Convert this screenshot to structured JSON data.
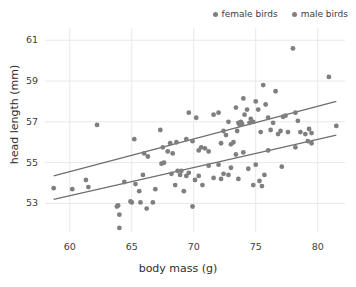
{
  "chart_data": {
    "type": "scatter",
    "title": "",
    "xlabel": "body mass (g)",
    "ylabel": "head length (mm)",
    "xlim": [
      58.0,
      82.2
    ],
    "ylim": [
      51.6,
      61.6
    ],
    "xticks": [
      "60",
      "65",
      "70",
      "75",
      "80"
    ],
    "xtick_values": [
      60,
      65,
      70,
      75,
      80
    ],
    "yticks": [
      "53",
      "55",
      "57",
      "59",
      "61"
    ],
    "ytick_values": [
      53,
      55,
      57,
      59,
      61
    ],
    "grid": true,
    "grid_color": "#e8e8e8",
    "point_color": "#7f7f7f",
    "line_color": "#6e6e6e",
    "legend_position": "top-right",
    "legend": [
      {
        "name": "female birds",
        "color": "#7f7f7f",
        "marker": "circle"
      },
      {
        "name": "male birds",
        "color": "#7f7f7f",
        "marker": "circle"
      }
    ],
    "series": [
      {
        "name": "female birds",
        "color": "#7f7f7f",
        "points": [
          [
            62.2,
            56.85
          ],
          [
            65.2,
            56.15
          ],
          [
            66.0,
            55.45
          ],
          [
            66.3,
            55.3
          ],
          [
            67.3,
            56.6
          ],
          [
            67.5,
            55.75
          ],
          [
            67.9,
            55.55
          ],
          [
            68.1,
            55.95
          ],
          [
            68.3,
            55.45
          ],
          [
            68.6,
            56.0
          ],
          [
            69.4,
            56.15
          ],
          [
            69.6,
            57.45
          ],
          [
            69.9,
            56.05
          ],
          [
            70.2,
            57.2
          ],
          [
            70.4,
            55.6
          ],
          [
            70.6,
            55.75
          ],
          [
            70.9,
            55.7
          ],
          [
            71.2,
            55.55
          ],
          [
            71.6,
            57.35
          ],
          [
            72.0,
            57.45
          ],
          [
            72.2,
            55.95
          ],
          [
            72.4,
            56.55
          ],
          [
            72.6,
            56.35
          ],
          [
            72.8,
            57.0
          ],
          [
            73.0,
            55.9
          ],
          [
            73.2,
            56.0
          ],
          [
            73.4,
            57.7
          ],
          [
            73.5,
            56.55
          ],
          [
            73.6,
            56.95
          ],
          [
            73.7,
            56.85
          ],
          [
            73.8,
            57.0
          ],
          [
            73.9,
            56.9
          ],
          [
            74.0,
            58.15
          ],
          [
            74.1,
            57.35
          ],
          [
            74.3,
            57.6
          ],
          [
            74.5,
            56.95
          ],
          [
            74.6,
            57.15
          ],
          [
            74.8,
            57.0
          ],
          [
            75.0,
            58.0
          ],
          [
            75.2,
            57.6
          ],
          [
            75.4,
            56.5
          ],
          [
            75.6,
            58.8
          ],
          [
            75.8,
            57.85
          ],
          [
            76.0,
            57.2
          ],
          [
            76.2,
            56.6
          ],
          [
            76.4,
            56.95
          ],
          [
            76.6,
            58.5
          ],
          [
            76.8,
            56.4
          ],
          [
            77.0,
            56.55
          ],
          [
            77.2,
            57.25
          ],
          [
            77.4,
            57.3
          ],
          [
            77.6,
            56.5
          ],
          [
            78.0,
            60.6
          ],
          [
            78.2,
            57.45
          ],
          [
            78.4,
            57.05
          ],
          [
            78.6,
            56.5
          ],
          [
            79.0,
            56.4
          ],
          [
            79.3,
            56.65
          ],
          [
            79.5,
            56.45
          ],
          [
            80.9,
            59.2
          ],
          [
            81.5,
            56.8
          ]
        ]
      },
      {
        "name": "male birds",
        "color": "#7f7f7f",
        "points": [
          [
            58.7,
            53.75
          ],
          [
            60.2,
            53.7
          ],
          [
            61.3,
            54.15
          ],
          [
            61.5,
            53.8
          ],
          [
            63.8,
            52.85
          ],
          [
            63.9,
            52.9
          ],
          [
            64.0,
            52.45
          ],
          [
            64.0,
            51.8
          ],
          [
            64.4,
            54.05
          ],
          [
            64.9,
            53.1
          ],
          [
            65.0,
            53.05
          ],
          [
            65.3,
            53.95
          ],
          [
            65.6,
            53.6
          ],
          [
            65.7,
            53.05
          ],
          [
            65.9,
            54.4
          ],
          [
            66.2,
            52.75
          ],
          [
            66.7,
            53.05
          ],
          [
            66.9,
            53.7
          ],
          [
            67.4,
            54.95
          ],
          [
            67.6,
            55.0
          ],
          [
            68.2,
            54.45
          ],
          [
            68.5,
            53.9
          ],
          [
            68.7,
            54.6
          ],
          [
            68.9,
            54.4
          ],
          [
            69.0,
            54.6
          ],
          [
            69.2,
            53.6
          ],
          [
            69.4,
            54.35
          ],
          [
            69.6,
            54.5
          ],
          [
            69.9,
            52.85
          ],
          [
            70.1,
            54.15
          ],
          [
            70.4,
            54.35
          ],
          [
            70.7,
            53.9
          ],
          [
            71.2,
            54.85
          ],
          [
            71.6,
            54.25
          ],
          [
            72.0,
            54.9
          ],
          [
            72.2,
            54.2
          ],
          [
            72.4,
            54.45
          ],
          [
            72.8,
            54.4
          ],
          [
            73.0,
            54.75
          ],
          [
            73.4,
            55.4
          ],
          [
            73.6,
            54.2
          ],
          [
            74.0,
            55.5
          ],
          [
            74.4,
            54.7
          ],
          [
            74.8,
            53.9
          ],
          [
            75.0,
            54.9
          ],
          [
            75.3,
            54.1
          ],
          [
            75.5,
            53.85
          ],
          [
            75.7,
            54.4
          ],
          [
            76.0,
            55.6
          ],
          [
            77.1,
            54.8
          ],
          [
            78.2,
            55.75
          ],
          [
            79.2,
            56.05
          ],
          [
            79.5,
            55.95
          ]
        ]
      }
    ],
    "trendlines": [
      {
        "name": "female birds trend",
        "color": "#6e6e6e",
        "x_start": 58.7,
        "y_start": 54.35,
        "x_end": 81.5,
        "y_end": 58.0
      },
      {
        "name": "male birds trend",
        "color": "#6e6e6e",
        "x_start": 58.7,
        "y_start": 53.2,
        "x_end": 81.5,
        "y_end": 56.35
      }
    ]
  }
}
